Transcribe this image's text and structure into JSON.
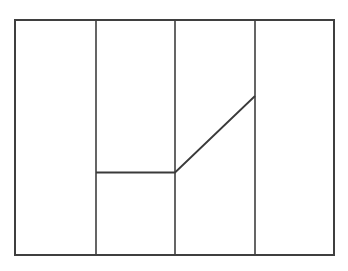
{
  "figure": {
    "title": "",
    "background_color": "#ffffff",
    "line_color": "#3f3f3f",
    "accent_line_color": "#3a3a3a",
    "frame": {
      "label": "outer-rectangle",
      "x1": 15,
      "y1": 20,
      "x2": 334,
      "y2": 255,
      "stroke_width": 2.0
    },
    "partitions": [
      {
        "label": "partition-1",
        "x": 96,
        "y1": 20,
        "y2": 255,
        "stroke_width": 1.6
      },
      {
        "label": "partition-2",
        "x": 175,
        "y1": 20,
        "y2": 255,
        "stroke_width": 1.6
      },
      {
        "label": "partition-3",
        "x": 255,
        "y1": 20,
        "y2": 255,
        "stroke_width": 1.6
      }
    ],
    "profile": {
      "label": "step-ramp-profile",
      "points": [
        {
          "x": 96,
          "y": 172.5
        },
        {
          "x": 175,
          "y": 172.5
        },
        {
          "x": 255,
          "y": 96
        }
      ],
      "stroke_width": 1.8
    }
  },
  "chart_data": {
    "type": "line",
    "title": "",
    "subtitle": "",
    "xlabel": "",
    "ylabel": "",
    "grid": false,
    "legend": null,
    "xlim": [
      15,
      334
    ],
    "ylim": [
      255,
      20
    ],
    "annotations": [],
    "series": [
      {
        "name": "profile",
        "x": [
          96,
          175,
          255
        ],
        "y": [
          172.5,
          172.5,
          96
        ]
      }
    ],
    "vertical_rules": [
      96,
      175,
      255
    ],
    "frame_bounds": {
      "left": 15,
      "top": 20,
      "right": 334,
      "bottom": 255
    }
  }
}
